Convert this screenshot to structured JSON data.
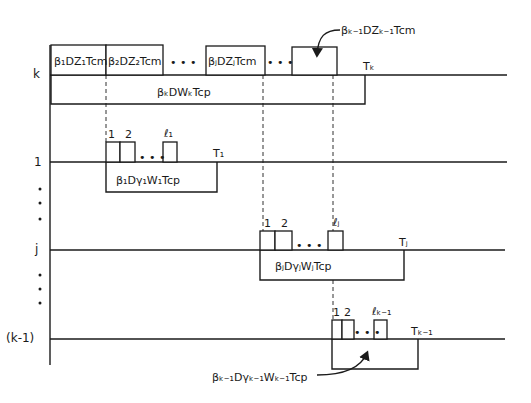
{
  "diagram": {
    "type": "processor timing diagram",
    "rows": [
      {
        "id": "k",
        "label": "k"
      },
      {
        "id": "1",
        "label": "1"
      },
      {
        "id": "j",
        "label": "j"
      },
      {
        "id": "k-1",
        "label": "(k-1)"
      }
    ],
    "row_k": {
      "comm_boxes": [
        {
          "label": "β₁DZ₁Tcm"
        },
        {
          "label": "β₂DZ₂Tcm"
        },
        {
          "label": "βⱼDZⱼTcm"
        },
        {
          "label": ""
        }
      ],
      "ellipsis": "• • •",
      "compute_label": "βₖDWₖTcp",
      "end_label": "Tₖ",
      "callout": "βₖ₋₁DZₖ₋₁Tcm"
    },
    "row_1": {
      "pulse_labels": [
        "1",
        "2",
        "ℓ₁"
      ],
      "ellipsis": "• • •",
      "compute_label": "β₁Dγ₁W₁Tcp",
      "end_label": "T₁"
    },
    "row_j": {
      "pulse_labels": [
        "1",
        "2",
        "ℓⱼ"
      ],
      "ellipsis": "• • •",
      "compute_label": "βⱼDγⱼWⱼTcp",
      "end_label": "Tⱼ"
    },
    "row_k1": {
      "pulse_labels": [
        "1",
        "2",
        "ℓₖ₋₁"
      ],
      "ellipsis": "• • •",
      "end_label": "Tₖ₋₁",
      "callout": "βₖ₋₁Dγₖ₋₁Wₖ₋₁Tcp"
    }
  }
}
